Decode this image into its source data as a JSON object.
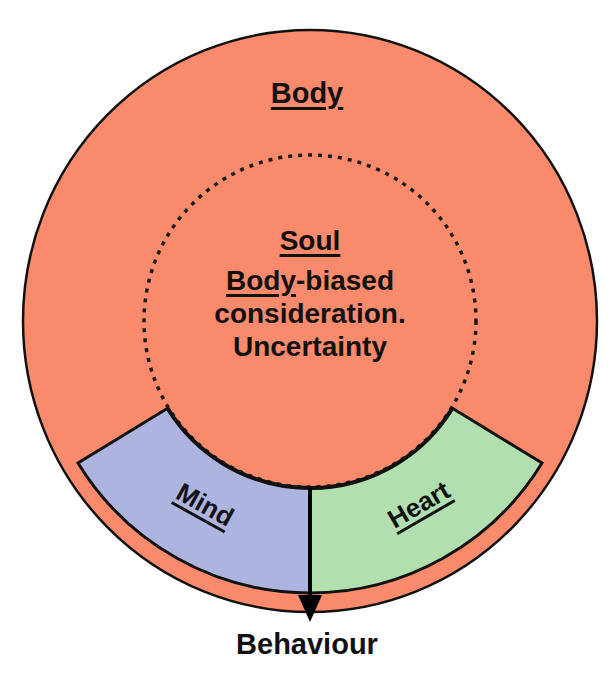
{
  "diagram": {
    "colors": {
      "body": "#f98a6c",
      "mind": "#aeb4e0",
      "heart": "#b1dfb0",
      "stroke": "#111111",
      "background": "#ffffff"
    },
    "outer_circle": {
      "label": "Body"
    },
    "inner_circle": {
      "title": "Soul",
      "description_underlined": "Body",
      "description_rest": "-biased",
      "description_line2": "consideration.",
      "description_line3": "Uncertainty"
    },
    "segments": [
      {
        "label": "Mind",
        "color_key": "mind"
      },
      {
        "label": "Heart",
        "color_key": "heart"
      }
    ],
    "output": {
      "label": "Behaviour"
    }
  }
}
